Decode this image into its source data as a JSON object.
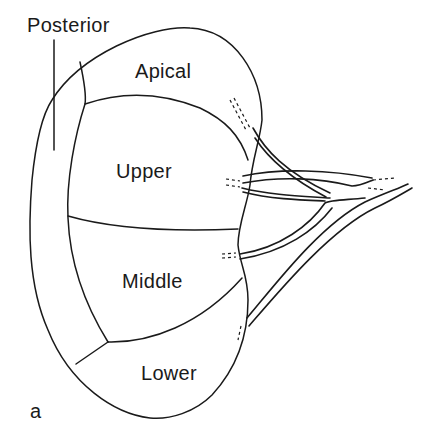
{
  "figure": {
    "panel_label": "a",
    "labels": {
      "posterior": "Posterior",
      "apical": "Apical",
      "upper": "Upper",
      "middle": "Middle",
      "lower": "Lower"
    },
    "colors": {
      "line": "#1a1a1a",
      "background": "#ffffff"
    }
  }
}
